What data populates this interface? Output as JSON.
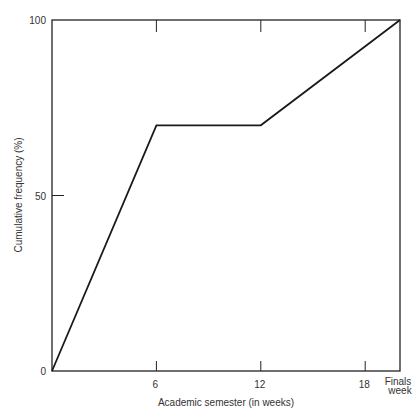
{
  "header_fragment": "",
  "chart_data": {
    "type": "line",
    "title": "",
    "xlabel": "Academic semester (in weeks)",
    "ylabel": "Cumulative frequency (%)",
    "x_ticks": [
      {
        "value": 6,
        "label": "6"
      },
      {
        "value": 12,
        "label": "12"
      },
      {
        "value": 18,
        "label": "18"
      }
    ],
    "x_end_label": [
      "Finals",
      "week"
    ],
    "y_ticks": [
      {
        "value": 0,
        "label": "0"
      },
      {
        "value": 50,
        "label": "50"
      },
      {
        "value": 100,
        "label": "100"
      }
    ],
    "xlim": [
      0,
      20
    ],
    "ylim": [
      0,
      100
    ],
    "grid": false,
    "legend": null,
    "series": [
      {
        "name": "Cumulative frequency",
        "x": [
          0,
          6,
          12,
          20
        ],
        "y": [
          0,
          70,
          70,
          100
        ]
      }
    ]
  },
  "style": {
    "line_color": "#1a1a1a",
    "axis_color": "#222222"
  }
}
